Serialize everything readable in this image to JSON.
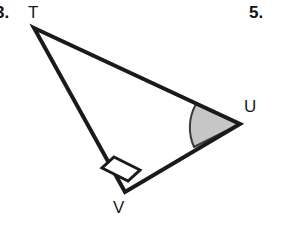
{
  "page": {
    "background_color": "#ffffff",
    "width": 284,
    "height": 239
  },
  "problem_numbers": {
    "left": "3.",
    "right": "5."
  },
  "figure": {
    "name": "right-triangle-tuv",
    "stroke_color": "#1a1a1a",
    "fill_color": "#ffffff",
    "angle_fill_color": "#c6c6c6",
    "stroke_width": 4,
    "vertices": [
      {
        "label": "T",
        "x": 34,
        "y": 28
      },
      {
        "label": "U",
        "x": 240,
        "y": 124
      },
      {
        "label": "V",
        "x": 125,
        "y": 192
      }
    ],
    "labels": {
      "t": "T",
      "u": "U",
      "v": "V"
    },
    "right_angle": {
      "at_vertex": "V",
      "marker": "square"
    },
    "marked_angle": {
      "at_vertex": "U",
      "marker": "shaded-sector"
    }
  }
}
